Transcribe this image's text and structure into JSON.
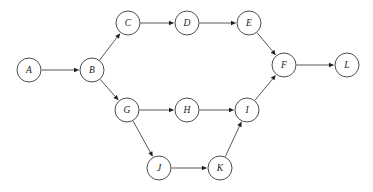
{
  "diagram": {
    "background_color": "#ffffff",
    "node_fill": "#ffffff",
    "node_stroke": "#3a3a3a",
    "edge_color": "#3a3a3a",
    "arrow_color": "#1f1f1f",
    "node_radius": 12,
    "width": 373,
    "height": 192
  },
  "nodes": [
    {
      "id": "A",
      "label": "A",
      "x": 29,
      "y": 70
    },
    {
      "id": "B",
      "label": "B",
      "x": 92,
      "y": 70
    },
    {
      "id": "C",
      "label": "C",
      "x": 128,
      "y": 23
    },
    {
      "id": "D",
      "label": "D",
      "x": 187,
      "y": 23
    },
    {
      "id": "E",
      "label": "E",
      "x": 249,
      "y": 23
    },
    {
      "id": "F",
      "label": "F",
      "x": 284,
      "y": 65
    },
    {
      "id": "G",
      "label": "G",
      "x": 127,
      "y": 110
    },
    {
      "id": "H",
      "label": "H",
      "x": 187,
      "y": 110
    },
    {
      "id": "I",
      "label": "I",
      "x": 247,
      "y": 110
    },
    {
      "id": "J",
      "label": "J",
      "x": 159,
      "y": 168
    },
    {
      "id": "K",
      "label": "K",
      "x": 220,
      "y": 168
    },
    {
      "id": "L",
      "label": "L",
      "x": 347,
      "y": 65
    }
  ],
  "edges": [
    {
      "from": "A",
      "to": "B"
    },
    {
      "from": "B",
      "to": "C"
    },
    {
      "from": "C",
      "to": "D"
    },
    {
      "from": "D",
      "to": "E"
    },
    {
      "from": "E",
      "to": "F"
    },
    {
      "from": "F",
      "to": "L"
    },
    {
      "from": "B",
      "to": "G"
    },
    {
      "from": "G",
      "to": "H"
    },
    {
      "from": "H",
      "to": "I"
    },
    {
      "from": "I",
      "to": "F"
    },
    {
      "from": "G",
      "to": "J"
    },
    {
      "from": "J",
      "to": "K"
    },
    {
      "from": "K",
      "to": "I"
    }
  ]
}
